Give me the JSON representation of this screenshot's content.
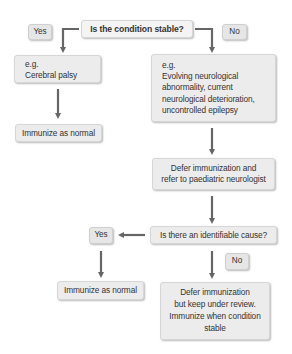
{
  "flowchart": {
    "question1": "Is the condition stable?",
    "yes1": "Yes",
    "no1": "No",
    "stable_example": {
      "lines": [
        "e.g.",
        "Cerebral palsy"
      ]
    },
    "unstable_example": {
      "lines": [
        "e.g.",
        "Evolving neurological",
        "abnormality, current",
        "neurological deterioration,",
        "uncontrolled epilepsy"
      ]
    },
    "immunize_normal_1": "Immunize as normal",
    "defer_refer": {
      "lines": [
        "Defer immunization and",
        "refer to paediatric neurologist"
      ]
    },
    "question2": "Is there an identifiable cause?",
    "yes2": "Yes",
    "no2": "No",
    "immunize_normal_2": "Immunize as normal",
    "defer_review": {
      "lines": [
        "Defer immunization",
        "but keep under review.",
        "Immunize when condition",
        "stable"
      ]
    }
  },
  "colors": {
    "box_fill": "#ececec",
    "box_border": "#d6d6d6",
    "arrow": "#666666",
    "text": "#333333"
  }
}
